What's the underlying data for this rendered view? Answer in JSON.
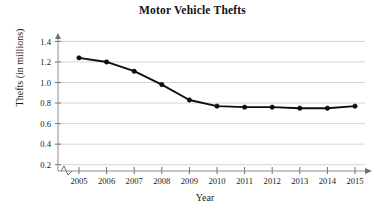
{
  "chart_data": {
    "type": "line",
    "title": "Motor Vehicle Thefts",
    "xlabel": "Year",
    "ylabel": "Thefts (in millions)",
    "categories": [
      "2005",
      "2006",
      "2007",
      "2008",
      "2009",
      "2010",
      "2011",
      "2012",
      "2013",
      "2014",
      "2015"
    ],
    "x": [
      2005,
      2006,
      2007,
      2008,
      2009,
      2010,
      2011,
      2012,
      2013,
      2014,
      2015
    ],
    "values": [
      1.24,
      1.2,
      1.11,
      0.98,
      0.83,
      0.77,
      0.76,
      0.76,
      0.75,
      0.75,
      0.77
    ],
    "series": [
      {
        "name": "Motor vehicle thefts",
        "values": [
          1.24,
          1.2,
          1.11,
          0.98,
          0.83,
          0.77,
          0.76,
          0.76,
          0.75,
          0.75,
          0.77
        ]
      }
    ],
    "ylim": [
      0,
      1.5
    ],
    "xlim": [
      2004.4,
      2015.6
    ],
    "yticks": [
      0.2,
      0.4,
      0.6,
      0.8,
      1.0,
      1.2,
      1.4
    ],
    "ytick_labels": [
      "0.2",
      "0.4",
      "0.6",
      "0.8",
      "1.0",
      "1.2",
      "1.4"
    ],
    "xticks": [
      2005,
      2006,
      2007,
      2008,
      2009,
      2010,
      2011,
      2012,
      2013,
      2014,
      2015
    ],
    "xtick_labels": [
      "2005",
      "2006",
      "2007",
      "2008",
      "2009",
      "2010",
      "2011",
      "2012",
      "2013",
      "2014",
      "2015"
    ],
    "grid": "horizontal",
    "legend": "none",
    "axis_break": "zigzag-on-x-axis-near-origin",
    "marker": "filled-circle",
    "line_color": "#0d0d0d",
    "grid_color": "#c9c9c9",
    "axis_color": "#8d8d8d"
  },
  "colors": {
    "line": "#0d0d0d",
    "marker": "#0d0d0d",
    "grid": "#c9c9c9",
    "axis": "#8d8d8d",
    "text": "#1a1a1a",
    "background": "#ffffff"
  }
}
